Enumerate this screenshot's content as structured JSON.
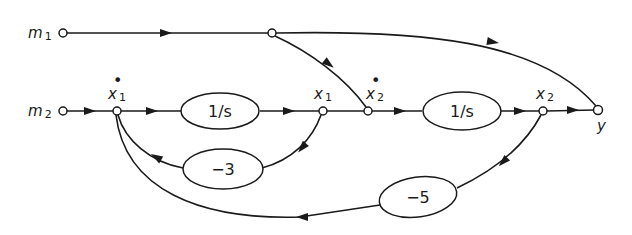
{
  "diagram": {
    "type": "signal-flow-graph",
    "colors": {
      "ink": "#1a1a1a",
      "background": "#ffffff"
    },
    "nodes": [
      {
        "id": "m1",
        "label": "m",
        "subscript": "1"
      },
      {
        "id": "branch",
        "label": ""
      },
      {
        "id": "m2",
        "label": "m",
        "subscript": "2"
      },
      {
        "id": "x1dot",
        "label": "x",
        "subscript": "1",
        "dot": "•"
      },
      {
        "id": "x1",
        "label": "x",
        "subscript": "1"
      },
      {
        "id": "x2dot",
        "label": "x",
        "subscript": "2",
        "dot": "•"
      },
      {
        "id": "x2",
        "label": "x",
        "subscript": "2"
      },
      {
        "id": "y",
        "label": "y"
      }
    ],
    "blocks": [
      {
        "id": "int1",
        "gain": "1/s"
      },
      {
        "id": "fb1",
        "gain": "−3"
      },
      {
        "id": "int2",
        "gain": "1/s"
      },
      {
        "id": "fb2",
        "gain": "−5"
      }
    ],
    "edges": [
      {
        "from": "m1",
        "to": "branch"
      },
      {
        "from": "branch",
        "to": "y"
      },
      {
        "from": "branch",
        "to": "x2dot"
      },
      {
        "from": "m2",
        "to": "x1dot"
      },
      {
        "from": "x1dot",
        "to": "x1",
        "via": "int1"
      },
      {
        "from": "x1",
        "to": "x1dot",
        "via": "fb1"
      },
      {
        "from": "x1",
        "to": "x2dot"
      },
      {
        "from": "x2dot",
        "to": "x2",
        "via": "int2"
      },
      {
        "from": "x2",
        "to": "y"
      },
      {
        "from": "x2",
        "to": "x1dot",
        "via": "fb2"
      }
    ]
  }
}
